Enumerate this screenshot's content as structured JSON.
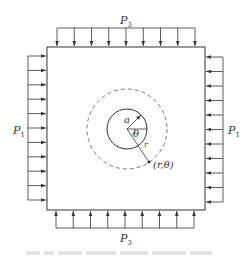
{
  "figure": {
    "labels": {
      "top_load": {
        "base": "P",
        "sub": "3"
      },
      "bottom_load": {
        "base": "P",
        "sub": "3"
      },
      "left_load": {
        "base": "P",
        "sub": "1"
      },
      "right_load": {
        "base": "P",
        "sub": "1"
      },
      "hole_radius": "a",
      "angle": "θ",
      "radius": "r",
      "point": "(r,θ)"
    },
    "caption": "",
    "geometry": {
      "plate": {
        "x": 47,
        "y": 47,
        "width": 158,
        "height": 163
      },
      "hole_center": [
        127,
        130
      ],
      "hole_radius": 20,
      "dashed_radius": 40,
      "point": [
        149,
        162
      ]
    },
    "colors": {
      "line": "#333333",
      "dashed": "#555555",
      "caption": "#e3e3e3"
    }
  }
}
